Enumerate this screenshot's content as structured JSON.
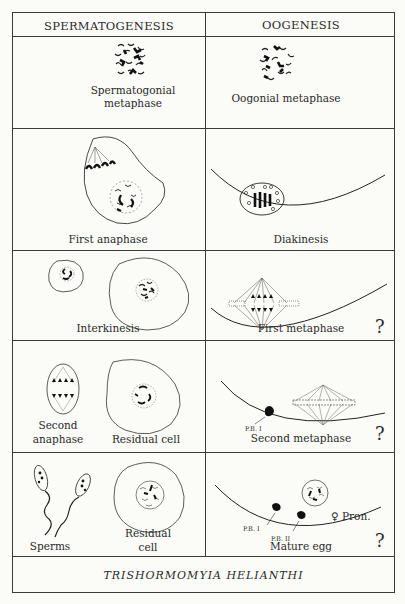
{
  "table": {
    "columns": [
      "SPERMATOGENESIS",
      "OOGENESIS"
    ],
    "rows": [
      {
        "spermatogenesis": [
          "Spermatogonial metaphase"
        ],
        "oogenesis": "Oogonial metaphase",
        "question_mark": ""
      },
      {
        "spermatogenesis": [
          "First anaphase"
        ],
        "oogenesis": "Diakinesis",
        "question_mark": ""
      },
      {
        "spermatogenesis": [
          "Interkinesis"
        ],
        "oogenesis": "First metaphase",
        "question_mark": "?"
      },
      {
        "spermatogenesis": [
          "Second anaphase",
          "Residual cell"
        ],
        "oogenesis": "Second metaphase",
        "question_mark": "?",
        "annotations": [
          "P.B. I"
        ]
      },
      {
        "spermatogenesis": [
          "Sperms",
          "Residual cell"
        ],
        "oogenesis": "Mature egg",
        "question_mark": "?",
        "annotations": [
          "P.B. I",
          "P.B. II",
          "♀ Pron."
        ]
      }
    ],
    "labels": {
      "r1_left_a": "Spermatogonial",
      "r1_left_b": "metaphase",
      "r1_right": "Oogonial metaphase",
      "r2_left": "First anaphase",
      "r2_right": "Diakinesis",
      "r3_left": "Interkinesis",
      "r3_right": "First metaphase",
      "r4_left_a1": "Second",
      "r4_left_a2": "anaphase",
      "r4_left_b": "Residual cell",
      "r4_right": "Second metaphase",
      "r4_pb1": "P.B. I",
      "r5_left_a": "Sperms",
      "r5_left_b1": "Residual",
      "r5_left_b2": "cell",
      "r5_right": "Mature egg",
      "r5_pb1": "P.B. I",
      "r5_pb2": "P.B. II",
      "r5_pron": "♀ Pron.",
      "question_mark": "?"
    },
    "footer": "TRISHORMOMYIA HELIANTHI"
  }
}
